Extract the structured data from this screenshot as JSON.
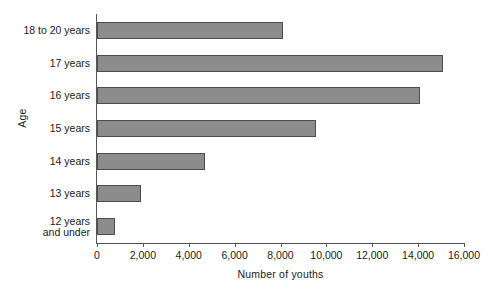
{
  "chart_data": {
    "type": "bar",
    "orientation": "horizontal",
    "title": "",
    "xlabel": "Number of youths",
    "ylabel": "Age",
    "categories": [
      "18 to 20 years",
      "17 years",
      "16 years",
      "15 years",
      "14 years",
      "13 years",
      "12 years\nand under"
    ],
    "values": [
      8100,
      15100,
      14100,
      9550,
      4700,
      1920,
      780
    ],
    "xlim": [
      0,
      16000
    ],
    "xticks": [
      0,
      2000,
      4000,
      6000,
      8000,
      10000,
      12000,
      14000,
      16000
    ],
    "xtick_labels": [
      "0",
      "2,000",
      "4,000",
      "6,000",
      "8,000",
      "10,000",
      "12,000",
      "14,000",
      "16,000"
    ],
    "grid": false,
    "legend": null,
    "bar_fill_color": "#8c8c8c",
    "bar_border_color": "#4d4d4d",
    "axis_color": "#555555",
    "background_color": "#ffffff"
  }
}
